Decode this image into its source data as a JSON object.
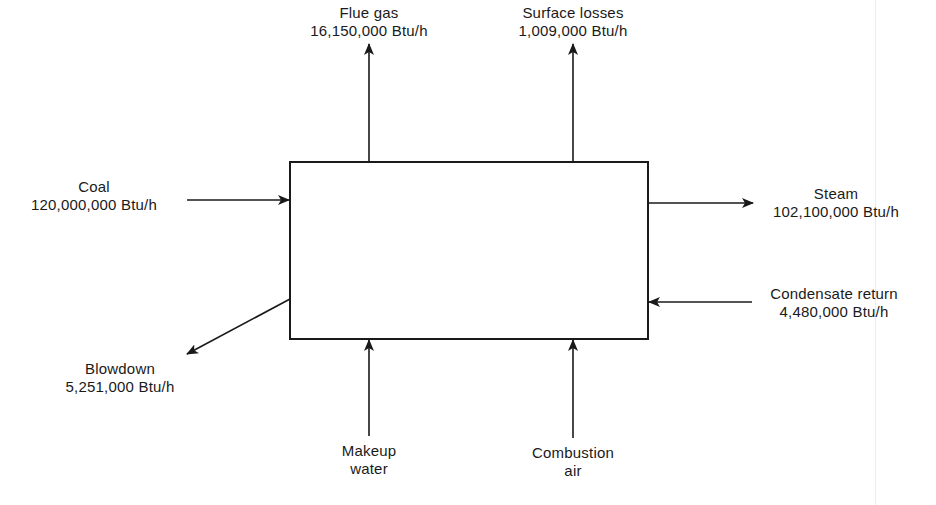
{
  "diagram": {
    "units": "Btu/h",
    "colors": {
      "line": "#1a1a1a",
      "background": "#ffffff"
    },
    "system_box": {
      "label": ""
    },
    "flows": {
      "flue_gas": {
        "name": "Flue gas",
        "value": "16,150,000 Btu/h",
        "direction": "out"
      },
      "surface_losses": {
        "name": "Surface losses",
        "value": "1,009,000 Btu/h",
        "direction": "out"
      },
      "coal": {
        "name": "Coal",
        "value": "120,000,000 Btu/h",
        "direction": "in"
      },
      "steam": {
        "name": "Steam",
        "value": "102,100,000 Btu/h",
        "direction": "out"
      },
      "condensate_return": {
        "name": "Condensate return",
        "value": "4,480,000 Btu/h",
        "direction": "in"
      },
      "blowdown": {
        "name": "Blowdown",
        "value": "5,251,000 Btu/h",
        "direction": "out"
      },
      "makeup_water": {
        "name_line1": "Makeup",
        "name_line2": "water",
        "direction": "in"
      },
      "combustion_air": {
        "name_line1": "Combustion",
        "name_line2": "air",
        "direction": "in"
      }
    }
  }
}
